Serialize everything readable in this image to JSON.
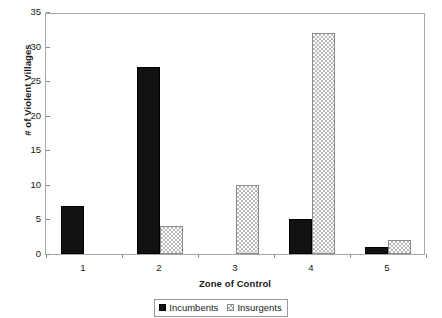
{
  "chart_data": {
    "type": "bar",
    "title": "",
    "subtitle": "",
    "xlabel": "Zone of Control",
    "ylabel": "# of Violent Villages",
    "categories": [
      "1",
      "2",
      "3",
      "4",
      "5"
    ],
    "series": [
      {
        "name": "Incumbents",
        "values": [
          7,
          27,
          0,
          5,
          1
        ],
        "color": "#121212",
        "fill": "solid-black"
      },
      {
        "name": "Insurgents",
        "values": [
          0,
          4,
          10,
          32,
          2
        ],
        "color": "#b9b9b9",
        "fill": "dotted-stipple"
      }
    ],
    "ylim": [
      0,
      35
    ],
    "yticks": [
      0,
      5,
      10,
      15,
      20,
      25,
      30,
      35
    ],
    "ytick_labels": [
      "0",
      "5",
      "10",
      "15",
      "20",
      "25",
      "30",
      "35"
    ],
    "grid": false,
    "legend_position": "bottom",
    "axis_frame": true,
    "bar_group_mode": "grouped"
  },
  "colors": {
    "frame": "#a8a8a8",
    "tick": "#8c8c8c",
    "text": "#1a1a1a",
    "incumbents": "#121212",
    "insurgents": "#b9b9b9",
    "background": "#ffffff"
  }
}
